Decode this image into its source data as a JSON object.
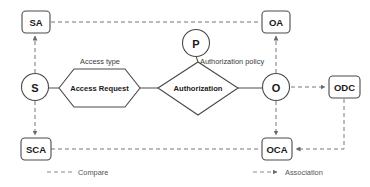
{
  "diagram": {
    "type": "entity-relationship",
    "colors": {
      "shape_stroke": "#4a4a4a",
      "solid_line": "#555555",
      "dashed_line": "#777777",
      "text": "#1a1a1a",
      "background": "#ffffff"
    },
    "entities": [
      {
        "id": "SA",
        "label": "SA",
        "shape": "rounded-rect",
        "x": 36,
        "y": 22
      },
      {
        "id": "OA",
        "label": "OA",
        "shape": "rounded-rect",
        "x": 276,
        "y": 22
      },
      {
        "id": "SCA",
        "label": "SCA",
        "shape": "rounded-rect",
        "x": 36,
        "y": 149
      },
      {
        "id": "OCA",
        "label": "OCA",
        "shape": "rounded-rect",
        "x": 277,
        "y": 149
      },
      {
        "id": "ODC",
        "label": "ODC",
        "shape": "rounded-rect",
        "x": 344,
        "y": 87
      }
    ],
    "circles": [
      {
        "id": "S",
        "label": "S",
        "shape": "circle",
        "x": 35,
        "y": 87
      },
      {
        "id": "P",
        "label": "P",
        "shape": "circle",
        "x": 196,
        "y": 43
      },
      {
        "id": "O",
        "label": "O",
        "shape": "circle",
        "x": 276,
        "y": 87
      }
    ],
    "relationships": [
      {
        "id": "access-request",
        "label": "Access Request",
        "shape": "hexagon",
        "x": 99,
        "y": 88
      },
      {
        "id": "authorization",
        "label": "Authorization",
        "shape": "diamond",
        "x": 198,
        "y": 88
      }
    ],
    "attributes": [
      {
        "id": "access-type",
        "label": "Access type",
        "x": 100,
        "y": 62
      },
      {
        "id": "authorization-policy",
        "label": "Authorization policy",
        "x": 240,
        "y": 61
      }
    ],
    "legend": [
      {
        "id": "compare",
        "label": "Compare",
        "style": "dashed",
        "x": 95,
        "y": 172
      },
      {
        "id": "association",
        "label": "Association",
        "style": "dashed-with-arrow",
        "x": 303,
        "y": 172
      }
    ],
    "edges": [
      {
        "id": "s-access-request",
        "from": "S",
        "to": "access-request",
        "style": "solid"
      },
      {
        "id": "access-request-authorization",
        "from": "access-request",
        "to": "authorization",
        "style": "solid"
      },
      {
        "id": "authorization-o",
        "from": "authorization",
        "to": "O",
        "style": "solid"
      },
      {
        "id": "p-authorization",
        "from": "P",
        "to": "authorization",
        "style": "solid"
      },
      {
        "id": "s-sa",
        "from": "S",
        "to": "SA",
        "style": "dashed",
        "arrow": "end"
      },
      {
        "id": "s-sca",
        "from": "S",
        "to": "SCA",
        "style": "dashed",
        "arrow": "end"
      },
      {
        "id": "o-oa",
        "from": "O",
        "to": "OA",
        "style": "dashed",
        "arrow": "end"
      },
      {
        "id": "o-oca",
        "from": "O",
        "to": "OCA",
        "style": "dashed",
        "arrow": "end"
      },
      {
        "id": "o-odc",
        "from": "O",
        "to": "ODC",
        "style": "dashed",
        "arrow": "end"
      },
      {
        "id": "sa-oa",
        "from": "SA",
        "to": "OA",
        "style": "dashed"
      },
      {
        "id": "sca-oca",
        "from": "SCA",
        "to": "OCA",
        "style": "dashed"
      },
      {
        "id": "odc-oca",
        "from": "ODC",
        "to": "OCA",
        "style": "dashed",
        "arrow": "end"
      }
    ]
  }
}
